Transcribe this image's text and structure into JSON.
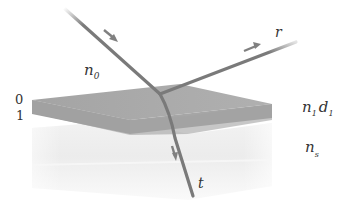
{
  "diagram": {
    "labels": {
      "incident_medium": "n",
      "incident_medium_sub": "0",
      "film_medium": "n",
      "film_medium_sub": "1",
      "film_thickness": "d",
      "film_thickness_sub": "1",
      "substrate_medium": "n",
      "substrate_medium_sub": "s",
      "reflected_ray": "r",
      "transmitted_ray": "t",
      "interface_top": "0",
      "interface_bottom": "1"
    },
    "colors": {
      "film_top": "#a8a8a8",
      "film_front": "#9c9c9c",
      "substrate": "#ececec",
      "ray": "#7a7a7a",
      "arrow": "#808080",
      "text": "#333333"
    }
  }
}
